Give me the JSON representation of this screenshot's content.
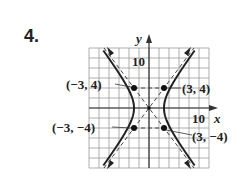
{
  "problem": {
    "number": "4."
  },
  "chart_data": {
    "type": "line",
    "title": "",
    "xlabel": "x",
    "ylabel": "y",
    "xlim": [
      -12,
      12
    ],
    "ylim": [
      -12,
      12
    ],
    "grid": true,
    "grid_step": 2,
    "tick_labels": {
      "x": "10",
      "y": "10"
    },
    "curve": {
      "name": "hyperbola",
      "equation": "x^2/9 - y^2/16 = 1",
      "vertices": [
        [
          -3,
          0
        ],
        [
          3,
          0
        ]
      ],
      "center": [
        0,
        0
      ]
    },
    "asymptotes": [
      {
        "equation": "y = 4/3 x",
        "style": "dashed"
      },
      {
        "equation": "y = -4/3 x",
        "style": "dashed"
      }
    ],
    "fundamental_rectangle": {
      "corners": [
        [
          -3,
          4
        ],
        [
          3,
          4
        ],
        [
          -3,
          -4
        ],
        [
          3,
          -4
        ]
      ],
      "style": "dashed"
    },
    "points": [
      {
        "label": "(−3, 4)",
        "x": -3,
        "y": 4
      },
      {
        "label": "(3, 4)",
        "x": 3,
        "y": 4
      },
      {
        "label": "(−3, −4)",
        "x": -3,
        "y": -4
      },
      {
        "label": "(3, −4)",
        "x": 3,
        "y": -4
      }
    ]
  },
  "labels": {
    "y_axis": "y",
    "x_axis": "x",
    "y_tick": "10",
    "x_tick": "10",
    "p1": "(−3, 4)",
    "p2": "(3, 4)",
    "p3": "(−3, −4)",
    "p4": "(3, −4)"
  }
}
